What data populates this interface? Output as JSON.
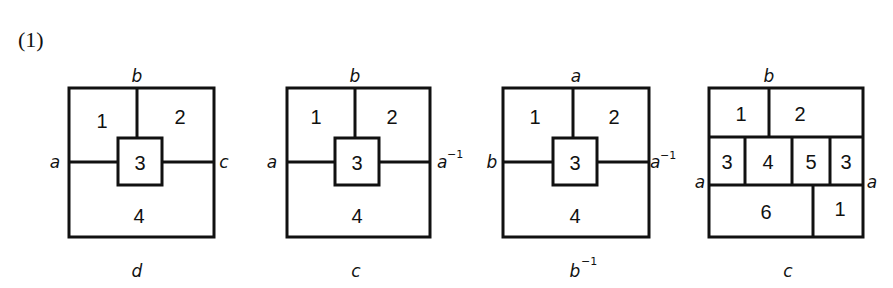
{
  "part_label": "(1)",
  "diagrams": [
    {
      "id": "d1",
      "edge_labels": {
        "top": "b",
        "left": "a",
        "right": "c",
        "bottom": "d"
      },
      "regions": [
        "1",
        "2",
        "3",
        "4"
      ]
    },
    {
      "id": "d2",
      "edge_labels": {
        "top": "b",
        "left": "a",
        "right": "a",
        "right_sup": "−1",
        "bottom": "c"
      },
      "regions": [
        "1",
        "2",
        "3",
        "4"
      ]
    },
    {
      "id": "d3",
      "edge_labels": {
        "top": "a",
        "left": "b",
        "right": "a",
        "right_sup": "−1",
        "bottom": "b",
        "bottom_sup": "−1"
      },
      "regions": [
        "1",
        "2",
        "3",
        "4"
      ]
    },
    {
      "id": "d4",
      "edge_labels": {
        "top": "b",
        "left": "a",
        "right": "a",
        "bottom": "c"
      },
      "regions": [
        "1",
        "2",
        "3",
        "4",
        "5",
        "3",
        "6",
        "1"
      ]
    }
  ],
  "colors": {
    "stroke": "#111111",
    "background": "#ffffff"
  }
}
